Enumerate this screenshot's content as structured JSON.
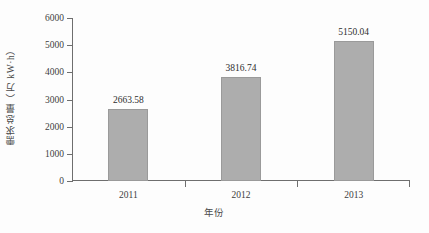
{
  "chart_data": {
    "type": "bar",
    "title": "",
    "subtitle": "",
    "categories": [
      "2011",
      "2012",
      "2013"
    ],
    "values": [
      2663.58,
      3816.74,
      5150.04
    ],
    "data_labels": [
      "2663.58",
      "3816.74",
      "5150.04"
    ],
    "xlabel": "年份",
    "ylabel": "需求总量（万 kW·h）",
    "ylim": [
      0,
      6000
    ],
    "yticks": [
      0,
      1000,
      2000,
      3000,
      4000,
      5000,
      6000
    ],
    "ytick_labels": [
      "0",
      "1000",
      "2000",
      "3000",
      "4000",
      "5000",
      "6000"
    ],
    "grid": false,
    "legend": null,
    "legend_position": "none",
    "bar_color": "#adadad",
    "bar_edge_color": "#9a9a9a",
    "axis_color": "#6e6e6e",
    "background_color": "#fdfdfd",
    "annotations": []
  }
}
